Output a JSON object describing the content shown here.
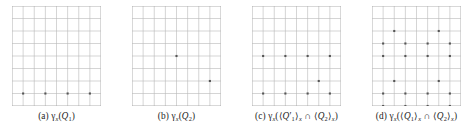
{
  "figure": {
    "type": "lattice-point-diagram-set",
    "panel_count": 4,
    "grid": {
      "cols": 8,
      "rows": 8,
      "line_color": "#b9b9b9",
      "border_color": "#a8a8a8",
      "dot_color": "#555555",
      "background": "#ffffff"
    }
  },
  "panels": [
    {
      "id": "panel-a",
      "label": "(a)",
      "caption_parts": {
        "gamma": "γ",
        "gamma_sub": "x",
        "open": "(",
        "body": "Q",
        "body_sub": "1",
        "close": ")"
      },
      "caption_text": "(a)  γₓ(Q₁)",
      "dots": [
        {
          "col": 1,
          "row": 7
        },
        {
          "col": 3,
          "row": 7
        },
        {
          "col": 5,
          "row": 7
        },
        {
          "col": 7,
          "row": 7
        }
      ]
    },
    {
      "id": "panel-b",
      "label": "(b)",
      "caption_parts": {
        "gamma": "γ",
        "gamma_sub": "x",
        "open": "(",
        "body": "Q",
        "body_sub": "2",
        "close": ")"
      },
      "caption_text": "(b)  γₓ(Q₂)",
      "dots": [
        {
          "col": 4,
          "row": 4
        },
        {
          "col": 7,
          "row": 6
        }
      ]
    },
    {
      "id": "panel-c",
      "label": "(c)",
      "caption_text": "(c)  γₓ(⟨Q′₁⟩ₓ ∩ ⟨Q₂⟩ₓ)",
      "caption_parts": {
        "gamma": "γ",
        "gamma_sub": "x",
        "q1": "Q",
        "q1_prime": "′",
        "q1_sub": "1",
        "q2": "Q",
        "q2_sub": "2",
        "angle_open": "⟨",
        "angle_close": "⟩",
        "intersect": "∩",
        "bracket_sub": "x"
      },
      "dots": [
        {
          "col": 1,
          "row": 4
        },
        {
          "col": 3,
          "row": 4
        },
        {
          "col": 5,
          "row": 4
        },
        {
          "col": 7,
          "row": 4
        },
        {
          "col": 6,
          "row": 6
        },
        {
          "col": 1,
          "row": 7
        },
        {
          "col": 3,
          "row": 7
        },
        {
          "col": 5,
          "row": 7
        },
        {
          "col": 7,
          "row": 7
        }
      ]
    },
    {
      "id": "panel-d",
      "label": "(d)",
      "caption_text": "(d)  γₓ(⟨Q₁⟩ₓ ∩ ⟨Q₂⟩ₓ)",
      "caption_parts": {
        "gamma": "γ",
        "gamma_sub": "x",
        "q1": "Q",
        "q1_sub": "1",
        "q2": "Q",
        "q2_sub": "2",
        "angle_open": "⟨",
        "angle_close": "⟩",
        "intersect": "∩",
        "bracket_sub": "x"
      },
      "dots": [
        {
          "col": 2,
          "row": 2
        },
        {
          "col": 6,
          "row": 2
        },
        {
          "col": 1,
          "row": 3
        },
        {
          "col": 3,
          "row": 3
        },
        {
          "col": 5,
          "row": 3
        },
        {
          "col": 7,
          "row": 3
        },
        {
          "col": 1,
          "row": 4
        },
        {
          "col": 3,
          "row": 4
        },
        {
          "col": 5,
          "row": 4
        },
        {
          "col": 7,
          "row": 4
        },
        {
          "col": 2,
          "row": 6
        },
        {
          "col": 6,
          "row": 6
        },
        {
          "col": 1,
          "row": 7
        },
        {
          "col": 3,
          "row": 7
        },
        {
          "col": 5,
          "row": 7
        },
        {
          "col": 7,
          "row": 7
        },
        {
          "col": 1,
          "row": 8
        },
        {
          "col": 3,
          "row": 8
        },
        {
          "col": 5,
          "row": 8
        },
        {
          "col": 7,
          "row": 8
        }
      ]
    }
  ]
}
